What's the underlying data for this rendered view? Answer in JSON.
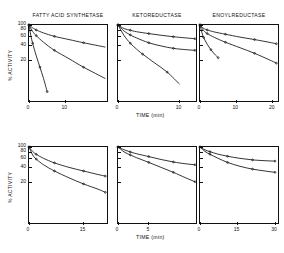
{
  "figure": {
    "background": "#ffffff",
    "ink": "#111111",
    "axis_title_x": "TIME  (min)",
    "axis_title_y": "% ACTIVITY"
  },
  "chart_data": [
    {
      "id": "fas-phenylglyoxal",
      "type": "line",
      "title": "FATTY ACID SYNTHETASE",
      "panel_row": 0,
      "panel_col": 0,
      "xlabel": "TIME  (min)",
      "ylabel": "% ACTIVITY",
      "xlim": [
        0,
        22
      ],
      "ylim": [
        0,
        100
      ],
      "xticks": [
        0,
        10
      ],
      "xtick_labels": [
        "0",
        "10"
      ],
      "yticks": [
        20,
        40,
        60,
        80,
        100
      ],
      "ytick_labels": [
        "20",
        "40",
        "60",
        "80",
        "100"
      ],
      "grid": false,
      "legend": "inline-annotations",
      "annotations": [
        {
          "text": "1 mM PHENYLGLYOXAL",
          "x": 4.2,
          "y": 79
        },
        {
          "text": "2 mM",
          "x": 4.0,
          "y": 42
        },
        {
          "text": "5 mM",
          "x": 4.4,
          "y": 13
        }
      ],
      "series": [
        {
          "name": "1 mM PHENYLGLYOXAL",
          "x": [
            0,
            1,
            2,
            4,
            7,
            11,
            15,
            21
          ],
          "values": [
            100,
            88,
            80,
            70,
            60,
            52,
            45,
            37
          ]
        },
        {
          "name": "2 mM",
          "x": [
            0,
            1,
            2,
            4,
            7,
            11,
            15,
            21
          ],
          "values": [
            100,
            75,
            62,
            46,
            32,
            22,
            15,
            9
          ]
        },
        {
          "name": "5 mM",
          "x": [
            0,
            0.5,
            1,
            2,
            3,
            4,
            5
          ],
          "values": [
            100,
            62,
            44,
            25,
            15,
            9,
            5
          ]
        }
      ]
    },
    {
      "id": "ketoreductase-phenylglyoxal",
      "type": "line",
      "title": "KETOREDUCTASE",
      "panel_row": 0,
      "panel_col": 1,
      "xlabel": "TIME  (min)",
      "ylabel": "% ACTIVITY",
      "xlim": [
        0,
        13
      ],
      "ylim": [
        0,
        100
      ],
      "xticks": [
        0,
        10
      ],
      "xtick_labels": [
        "0",
        "10"
      ],
      "yticks": [
        20,
        40,
        60,
        80,
        100
      ],
      "ytick_labels": [
        "20",
        "40",
        "60",
        "80",
        "100"
      ],
      "grid": false,
      "legend": "inline-annotations",
      "annotations": [
        {
          "text": "1 mM",
          "x": 5.2,
          "y": 82
        },
        {
          "text": "PHENYLGLYOXAL",
          "x": 4.6,
          "y": 73
        },
        {
          "text": "2 mM",
          "x": 4.0,
          "y": 49
        },
        {
          "text": "5 mM",
          "x": 3.6,
          "y": 19
        }
      ],
      "series": [
        {
          "name": "1 mM PHENYLGLYOXAL",
          "x": [
            0,
            1,
            2,
            3,
            5,
            7,
            9,
            11,
            12.5
          ],
          "values": [
            100,
            85,
            79,
            74,
            68,
            63,
            59,
            56,
            54
          ]
        },
        {
          "name": "2 mM",
          "x": [
            0,
            1,
            2,
            3,
            5,
            7,
            9,
            11,
            12.5
          ],
          "values": [
            100,
            76,
            64,
            56,
            45,
            39,
            35,
            33,
            32
          ]
        },
        {
          "name": "5 mM",
          "x": [
            0,
            1,
            2,
            3,
            4,
            6,
            8,
            10
          ],
          "values": [
            100,
            62,
            44,
            34,
            27,
            18,
            12,
            7
          ]
        }
      ]
    },
    {
      "id": "enoylreductase-phenylglyoxal",
      "type": "line",
      "title": "ENOYLREDUCTASE",
      "panel_row": 0,
      "panel_col": 2,
      "xlabel": "TIME  (min)",
      "ylabel": "% ACTIVITY",
      "xlim": [
        0,
        22
      ],
      "ylim": [
        0,
        100
      ],
      "xticks": [
        0,
        10,
        20
      ],
      "xtick_labels": [
        "0",
        "10",
        "20"
      ],
      "yticks": [
        20,
        40,
        60,
        80,
        100
      ],
      "ytick_labels": [
        "20",
        "40",
        "60",
        "80",
        "100"
      ],
      "grid": false,
      "legend": "inline-annotations",
      "annotations": [
        {
          "text": "1 mM",
          "x": 3.8,
          "y": 82
        },
        {
          "text": "PHENYLGLYOXAL",
          "x": 3.2,
          "y": 73
        },
        {
          "text": "2 mM",
          "x": 3.6,
          "y": 57
        },
        {
          "text": "5 mM",
          "x": 3.4,
          "y": 24
        }
      ],
      "series": [
        {
          "name": "1 mM PHENYLGLYOXAL",
          "x": [
            0,
            1,
            2,
            4,
            7,
            11,
            15,
            19,
            21
          ],
          "values": [
            100,
            86,
            80,
            73,
            66,
            58,
            52,
            46,
            43
          ]
        },
        {
          "name": "2 mM",
          "x": [
            0,
            1,
            2,
            4,
            7,
            11,
            15,
            19,
            21
          ],
          "values": [
            100,
            78,
            68,
            57,
            46,
            36,
            28,
            21,
            18
          ]
        },
        {
          "name": "5 mM",
          "x": [
            0,
            0.5,
            1,
            2,
            3,
            4,
            5
          ],
          "values": [
            100,
            72,
            57,
            42,
            33,
            27,
            23
          ]
        }
      ]
    },
    {
      "id": "fas-butanedione",
      "type": "line",
      "title": "",
      "panel_row": 1,
      "panel_col": 0,
      "xlabel": "TIME  (min)",
      "ylabel": "% ACTIVITY",
      "xlim": [
        0,
        22
      ],
      "ylim": [
        0,
        100
      ],
      "xticks": [
        0,
        15
      ],
      "xtick_labels": [
        "0",
        "15"
      ],
      "yticks": [
        20,
        40,
        60,
        80,
        100
      ],
      "ytick_labels": [
        "20",
        "40",
        "60",
        "80",
        "100"
      ],
      "grid": false,
      "legend": "inline-annotations",
      "annotations": [
        {
          "text": "10 mM BUTANEDIONE",
          "x": 3.4,
          "y": 80
        },
        {
          "text": "20 mM",
          "x": 2.6,
          "y": 41
        }
      ],
      "series": [
        {
          "name": "10 mM BUTANEDIONE",
          "x": [
            0,
            1,
            2,
            4,
            7,
            11,
            15,
            19,
            21
          ],
          "values": [
            100,
            82,
            72,
            60,
            49,
            40,
            34,
            29,
            27
          ]
        },
        {
          "name": "20 mM",
          "x": [
            0,
            1,
            2,
            4,
            7,
            11,
            15,
            19,
            21
          ],
          "values": [
            100,
            70,
            58,
            45,
            34,
            25,
            19,
            15,
            13
          ]
        }
      ]
    },
    {
      "id": "ketoreductase-butanedione",
      "type": "line",
      "title": "",
      "panel_row": 1,
      "panel_col": 1,
      "xlabel": "TIME  (min)",
      "ylabel": "% ACTIVITY",
      "xlim": [
        0,
        13
      ],
      "ylim": [
        0,
        100
      ],
      "xticks": [
        0,
        5
      ],
      "xtick_labels": [
        "0",
        "5"
      ],
      "yticks": [
        20,
        40,
        60,
        80,
        100
      ],
      "ytick_labels": [
        "20",
        "40",
        "60",
        "80",
        "100"
      ],
      "grid": false,
      "legend": "inline-annotations",
      "annotations": [
        {
          "text": "10 mM",
          "x": 5.0,
          "y": 84
        },
        {
          "text": "BUTANEDIONE",
          "x": 4.6,
          "y": 76
        },
        {
          "text": "20 mM",
          "x": 4.8,
          "y": 36
        }
      ],
      "series": [
        {
          "name": "10 mM BUTANEDIONE",
          "x": [
            0,
            1,
            2,
            3,
            5,
            7,
            9,
            11,
            12.5
          ],
          "values": [
            100,
            88,
            80,
            74,
            65,
            57,
            51,
            47,
            45
          ]
        },
        {
          "name": "20 mM",
          "x": [
            0,
            1,
            2,
            3,
            5,
            7,
            9,
            11,
            12.5
          ],
          "values": [
            100,
            80,
            70,
            62,
            50,
            40,
            32,
            25,
            21
          ]
        }
      ]
    },
    {
      "id": "enoylreductase-butanedione",
      "type": "line",
      "title": "",
      "panel_row": 1,
      "panel_col": 2,
      "xlabel": "TIME  (min)",
      "ylabel": "% ACTIVITY",
      "xlim": [
        0,
        32
      ],
      "ylim": [
        0,
        100
      ],
      "xticks": [
        0,
        15,
        30
      ],
      "xtick_labels": [
        "0",
        "15",
        "30"
      ],
      "yticks": [
        20,
        40,
        60,
        80,
        100
      ],
      "ytick_labels": [
        "20",
        "40",
        "60",
        "80",
        "100"
      ],
      "grid": false,
      "legend": "inline-annotations",
      "annotations": [
        {
          "text": "5 mM",
          "x": 9.0,
          "y": 86
        },
        {
          "text": "BUTANEDIONE",
          "x": 7.6,
          "y": 78
        },
        {
          "text": "10 mM",
          "x": 6.0,
          "y": 38
        }
      ],
      "series": [
        {
          "name": "5 mM BUTANEDIONE",
          "x": [
            0,
            2,
            4,
            7,
            11,
            16,
            21,
            26,
            30
          ],
          "values": [
            100,
            88,
            81,
            73,
            66,
            60,
            56,
            54,
            53
          ]
        },
        {
          "name": "10 mM",
          "x": [
            0,
            2,
            4,
            7,
            11,
            16,
            21,
            26,
            30
          ],
          "values": [
            100,
            82,
            72,
            61,
            50,
            42,
            37,
            34,
            32
          ]
        }
      ]
    }
  ]
}
